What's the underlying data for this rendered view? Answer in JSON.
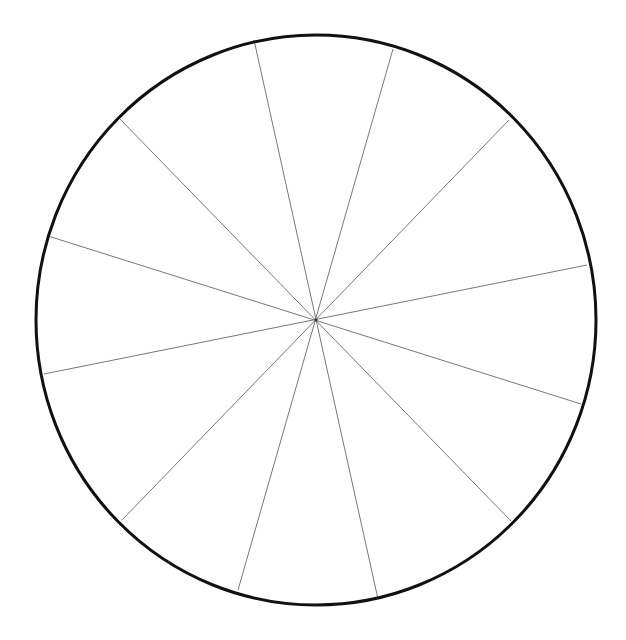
{
  "diagram": {
    "type": "blank-segmented-circle",
    "segment_count": 12,
    "center": {
      "x": 316,
      "y": 320
    },
    "radius": {
      "rx": 280,
      "ry": 285
    },
    "outline_color": "#111111",
    "outline_width": 3,
    "spoke_color": "#777777",
    "spoke_width": 1,
    "spokes": [
      {
        "x1": 254,
        "y1": 40,
        "x2": 378,
        "y2": 599
      },
      {
        "x1": 393,
        "y1": 49,
        "x2": 238,
        "y2": 590
      },
      {
        "x1": 509,
        "y1": 120,
        "x2": 122,
        "y2": 520
      },
      {
        "x1": 587,
        "y1": 265,
        "x2": 44,
        "y2": 374
      },
      {
        "x1": 581,
        "y1": 404,
        "x2": 48,
        "y2": 236
      },
      {
        "x1": 511,
        "y1": 521,
        "x2": 118,
        "y2": 117
      }
    ]
  }
}
